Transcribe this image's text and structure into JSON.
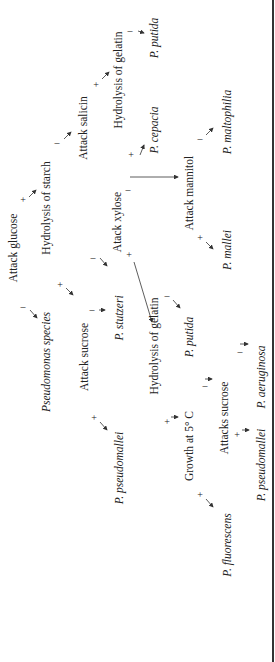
{
  "figure": {
    "root": "Pseudomonas species",
    "nodes": [
      {
        "id": "glucose",
        "label": "Attack glucose",
        "x": 14,
        "y": 248
      },
      {
        "id": "starch",
        "label": "Hydrolysis of starch",
        "x": 47,
        "y": 208
      },
      {
        "id": "salicin",
        "label": "Attack salicin",
        "x": 84,
        "y": 128
      },
      {
        "id": "gelatin_top",
        "label": "Hydrolysis of gelatin",
        "x": 119,
        "y": 80
      },
      {
        "id": "xylose",
        "label": "Atack xylose",
        "x": 118,
        "y": 222
      },
      {
        "id": "mannitol",
        "label": "Attack mannitol",
        "x": 190,
        "y": 193
      },
      {
        "id": "root",
        "label": "Pseudomonas species",
        "x": 47,
        "y": 362
      },
      {
        "id": "sucrose",
        "label": "Attack sucrose",
        "x": 85,
        "y": 357
      },
      {
        "id": "gelatin_mid",
        "label": "Hydrolysis of gelatin",
        "x": 155,
        "y": 346
      },
      {
        "id": "growth5",
        "label": "Growth at 5° C",
        "x": 190,
        "y": 446
      },
      {
        "id": "attacks_sucrose",
        "label": "Attacks sucrose",
        "x": 225,
        "y": 418
      }
    ],
    "species": [
      {
        "id": "putida_top",
        "label": "P. putida",
        "x": 155,
        "y": 38
      },
      {
        "id": "cepacia",
        "label": "P. cepacia",
        "x": 155,
        "y": 130
      },
      {
        "id": "maltophilia",
        "label": "P. maltophilia",
        "x": 228,
        "y": 122
      },
      {
        "id": "mallei",
        "label": "P. mallei",
        "x": 228,
        "y": 250
      },
      {
        "id": "stutzeri",
        "label": "P. stutzeri",
        "x": 120,
        "y": 318
      },
      {
        "id": "putida_mid",
        "label": "P. putida",
        "x": 190,
        "y": 337
      },
      {
        "id": "pseudomallei_1",
        "label": "P. pseudomallei",
        "x": 120,
        "y": 468
      },
      {
        "id": "aeruginosa",
        "label": "P. aeruginosa",
        "x": 262,
        "y": 377
      },
      {
        "id": "pseudomallei_2",
        "label": "P. pseudomallei",
        "x": 262,
        "y": 465
      },
      {
        "id": "fluorescens",
        "label": "P. fluorescens",
        "x": 228,
        "y": 545
      }
    ],
    "signs": [
      {
        "s": "+",
        "x": 23,
        "y": 200
      },
      {
        "s": "–",
        "x": 23,
        "y": 307
      },
      {
        "s": "–",
        "x": 57,
        "y": 143
      },
      {
        "s": "+",
        "x": 60,
        "y": 285
      },
      {
        "s": "–",
        "x": 93,
        "y": 258
      },
      {
        "s": "+",
        "x": 96,
        "y": 85
      },
      {
        "s": "+",
        "x": 131,
        "y": 155
      },
      {
        "s": "–",
        "x": 130,
        "y": 31
      },
      {
        "s": "–",
        "x": 128,
        "y": 190
      },
      {
        "s": "+",
        "x": 129,
        "y": 255
      },
      {
        "s": "–",
        "x": 92,
        "y": 310
      },
      {
        "s": "+",
        "x": 94,
        "y": 418
      },
      {
        "s": "–",
        "x": 200,
        "y": 139
      },
      {
        "s": "+",
        "x": 200,
        "y": 238
      },
      {
        "s": "–",
        "x": 167,
        "y": 296
      },
      {
        "s": "+",
        "x": 167,
        "y": 422
      },
      {
        "s": "–",
        "x": 205,
        "y": 386
      },
      {
        "s": "+",
        "x": 200,
        "y": 495
      },
      {
        "s": "–",
        "x": 240,
        "y": 352
      },
      {
        "s": "+",
        "x": 237,
        "y": 435
      }
    ]
  }
}
